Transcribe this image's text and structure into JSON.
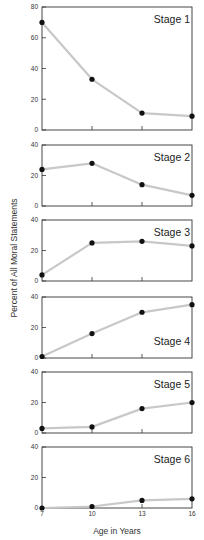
{
  "chart_data": {
    "type": "line",
    "layout": "six vertically stacked small-multiple panels sharing x axis",
    "x": [
      7,
      10,
      13,
      16
    ],
    "xlabel": "Age in Years",
    "ylabel": "Percent of All Moral Statements",
    "grid": false,
    "legend": null,
    "panels": [
      {
        "name": "Stage 1",
        "ylim": [
          0,
          80
        ],
        "yticks": [
          0,
          20,
          40,
          60,
          80
        ],
        "values": [
          70,
          33,
          11,
          9
        ]
      },
      {
        "name": "Stage 2",
        "ylim": [
          0,
          40
        ],
        "yticks": [
          0,
          20,
          40
        ],
        "values": [
          24,
          28,
          14,
          7
        ]
      },
      {
        "name": "Stage 3",
        "ylim": [
          0,
          40
        ],
        "yticks": [
          0,
          20,
          40
        ],
        "values": [
          4,
          25,
          26,
          23
        ]
      },
      {
        "name": "Stage 4",
        "ylim": [
          0,
          40
        ],
        "yticks": [
          0,
          20,
          40
        ],
        "values": [
          1,
          16,
          30,
          35
        ]
      },
      {
        "name": "Stage 5",
        "ylim": [
          0,
          40
        ],
        "yticks": [
          0,
          20,
          40
        ],
        "values": [
          3,
          4,
          16,
          20
        ]
      },
      {
        "name": "Stage 6",
        "ylim": [
          0,
          40
        ],
        "yticks": [
          0,
          20,
          40
        ],
        "values": [
          0,
          1,
          5,
          6
        ]
      }
    ],
    "colors": {
      "line": "#c8c8c8",
      "marker": "#111111",
      "frame": "#333333"
    }
  }
}
